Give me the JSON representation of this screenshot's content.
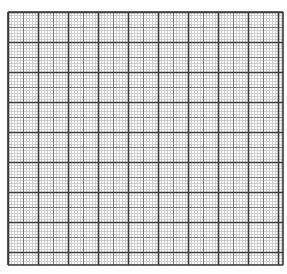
{
  "graph_paper": {
    "grid": {
      "left": 8,
      "top": 12,
      "width": 275,
      "height": 253,
      "major_spacing": 30,
      "minor_divisions": 10,
      "major_color": "#3a3a3a",
      "mid_color": "#7a7a7a",
      "minor_color": "#c4c4c4",
      "background": "#ffffff"
    }
  }
}
